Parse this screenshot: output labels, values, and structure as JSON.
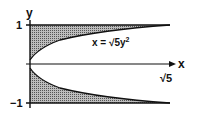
{
  "figure": {
    "axis_x_label": "x",
    "axis_y_label": "y",
    "tick_y_top": "1",
    "tick_y_bottom": "−1",
    "tick_x": "√5",
    "curve_label_prefix": "x = ",
    "curve_label_root": "√5",
    "curve_label_suffix": "y",
    "curve_label_exp": "2"
  },
  "colors": {
    "ink": "#111111",
    "hatch": "#777777",
    "background": "#ffffff"
  }
}
